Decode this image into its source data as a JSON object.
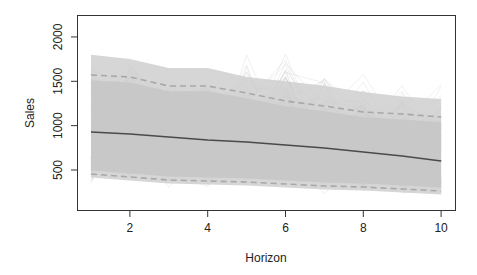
{
  "chart_data": {
    "type": "line",
    "title": "",
    "xlabel": "Horizon",
    "ylabel": "Sales",
    "x": [
      1,
      2,
      3,
      4,
      5,
      6,
      7,
      8,
      9,
      10
    ],
    "xlim": [
      0.6,
      10.4
    ],
    "ylim": [
      145,
      2215
    ],
    "x_ticks": [
      2,
      4,
      6,
      8,
      10
    ],
    "y_ticks": [
      500,
      1000,
      1500,
      2000
    ],
    "grid": false,
    "legend": null,
    "series": [
      {
        "name": "median",
        "style": "solid",
        "color": "#4a4a4a",
        "values": [
          928,
          906,
          872,
          838,
          816,
          782,
          748,
          703,
          658,
          601
        ]
      },
      {
        "name": "upper_interval",
        "style": "dashed",
        "color": "#a8a8a8",
        "values": [
          1571,
          1548,
          1447,
          1447,
          1368,
          1278,
          1222,
          1154,
          1131,
          1098
        ]
      },
      {
        "name": "lower_interval",
        "style": "dashed",
        "color": "#a8a8a8",
        "values": [
          455,
          421,
          387,
          376,
          365,
          342,
          320,
          308,
          286,
          263
        ]
      }
    ],
    "simulated_paths": {
      "description": "many light-gray simulated sample paths forming a dense band",
      "color": "#c8c8c8",
      "band_top": [
        1800,
        1750,
        1650,
        1650,
        1550,
        1500,
        1450,
        1380,
        1330,
        1300
      ],
      "band_bottom": [
        320,
        280,
        300,
        250,
        260,
        240,
        230,
        210,
        200,
        190
      ],
      "peak_max": [
        1850,
        2000,
        1750,
        1800,
        1950,
        2050,
        1800,
        1750,
        1600,
        1500
      ]
    }
  },
  "labels": {
    "xlabel": "Horizon",
    "ylabel": "Sales",
    "x_ticks": [
      "2",
      "4",
      "6",
      "8",
      "10"
    ],
    "y_ticks": [
      "500",
      "1000",
      "1500",
      "2000"
    ]
  }
}
